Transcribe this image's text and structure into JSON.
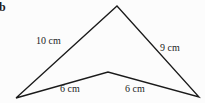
{
  "figure": {
    "part_label": "b",
    "background_color": "#fcfcfc",
    "stroke_color": "#1a1a1a",
    "text_color": "#1c1c1c"
  },
  "shape": {
    "name": "concave-quadrilateral",
    "description": "arrowhead / dart shape",
    "vertices": [
      {
        "name": "apex-top",
        "x": 117,
        "y": 6
      },
      {
        "name": "vertex-right",
        "x": 199,
        "y": 97
      },
      {
        "name": "vertex-bottom-middle",
        "x": 108,
        "y": 72
      },
      {
        "name": "vertex-left",
        "x": 16,
        "y": 98
      }
    ],
    "path": "M 117 6 L 199 97 L 108 72 L 16 98 Z"
  },
  "labels": {
    "left_upper_side": "10 cm",
    "right_upper_side": "9 cm",
    "left_lower_side": "6 cm",
    "right_lower_side": "6 cm"
  },
  "measurements": [
    {
      "side": "apex-to-left-vertex",
      "value": 10,
      "unit": "cm",
      "text": "10 cm"
    },
    {
      "side": "apex-to-right-vertex",
      "value": 9,
      "unit": "cm",
      "text": "9 cm"
    },
    {
      "side": "left-vertex-to-bottom-middle",
      "value": 6,
      "unit": "cm",
      "text": "6 cm"
    },
    {
      "side": "bottom-middle-to-right-vertex",
      "value": 6,
      "unit": "cm",
      "text": "6 cm"
    }
  ]
}
